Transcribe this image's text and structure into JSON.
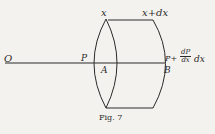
{
  "figure": {
    "caption": "Fig. 7",
    "labels": {
      "origin": "O",
      "x_left": "x",
      "x_right": "x+dx",
      "p_left": "P",
      "a_point": "A",
      "b_point": "B",
      "p_right_prefix": "P+",
      "frac_num": "dP",
      "frac_den": "dx",
      "p_right_suffix": "dx"
    },
    "colors": {
      "ink": "#2a2a2a",
      "paper": "#f4f2ee"
    }
  }
}
